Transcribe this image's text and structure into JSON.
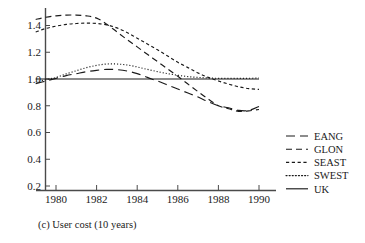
{
  "chart_data": {
    "type": "line",
    "title": "",
    "caption": "(c) User cost  (10 years)",
    "xlabel": "",
    "ylabel": "",
    "xlim": [
      1978.6,
      1990.9
    ],
    "ylim": [
      0.1,
      1.5
    ],
    "grid": false,
    "legend_position": "right",
    "xticks": [
      "1980",
      "1982",
      "1984",
      "1986",
      "1988",
      "1990"
    ],
    "xtick_values": [
      1980,
      1982,
      1984,
      1986,
      1988,
      1990
    ],
    "yticks": [
      "0.2",
      "0.4",
      "0.6",
      "0.8",
      "1.0",
      "1.2",
      "1.4"
    ],
    "ytick_values": [
      0.2,
      0.4,
      0.6,
      0.8,
      1.0,
      1.2,
      1.4
    ],
    "x": [
      1979,
      1979.5,
      1980,
      1980.5,
      1981,
      1981.5,
      1982,
      1982.5,
      1983,
      1983.5,
      1984,
      1984.5,
      1985,
      1985.5,
      1986,
      1986.5,
      1987,
      1987.5,
      1988,
      1988.5,
      1989,
      1989.5,
      1990
    ],
    "series": [
      {
        "name": "EANG",
        "dash": "long-dash",
        "values": [
          0.965,
          0.985,
          1.005,
          1.025,
          1.04,
          1.055,
          1.065,
          1.072,
          1.07,
          1.06,
          1.04,
          1.012,
          0.985,
          0.955,
          0.925,
          0.895,
          0.865,
          0.83,
          0.8,
          0.785,
          0.765,
          0.765,
          0.795
        ]
      },
      {
        "name": "GLON",
        "dash": "medium-dash",
        "values": [
          1.445,
          1.462,
          1.472,
          1.478,
          1.478,
          1.472,
          1.455,
          1.41,
          1.352,
          1.295,
          1.24,
          1.185,
          1.13,
          1.075,
          1.02,
          0.962,
          0.905,
          0.85,
          0.8,
          0.778,
          0.758,
          0.762,
          0.772
        ]
      },
      {
        "name": "SEAST",
        "dash": "short-dash",
        "values": [
          1.352,
          1.378,
          1.395,
          1.408,
          1.415,
          1.418,
          1.415,
          1.405,
          1.382,
          1.348,
          1.305,
          1.262,
          1.218,
          1.172,
          1.125,
          1.085,
          1.045,
          1.012,
          0.985,
          0.962,
          0.942,
          0.928,
          0.922
        ]
      },
      {
        "name": "SWEST",
        "dash": "dotted",
        "values": [
          0.978,
          0.995,
          1.012,
          1.038,
          1.062,
          1.085,
          1.102,
          1.112,
          1.112,
          1.105,
          1.09,
          1.072,
          1.055,
          1.04,
          1.028,
          1.018,
          1.012,
          1.008,
          1.005,
          1.005,
          1.005,
          1.005,
          1.008
        ]
      },
      {
        "name": "UK",
        "dash": "solid",
        "values": [
          1.0,
          1.0,
          1.0,
          1.0,
          1.0,
          1.0,
          1.0,
          1.0,
          1.0,
          1.0,
          1.0,
          1.0,
          1.0,
          1.0,
          1.0,
          1.0,
          1.0,
          1.0,
          1.0,
          1.0,
          1.0,
          1.0,
          1.0
        ]
      }
    ]
  },
  "legend": {
    "entries": [
      {
        "label": "EANG"
      },
      {
        "label": "GLON"
      },
      {
        "label": "SEAST"
      },
      {
        "label": "SWEST"
      },
      {
        "label": "UK"
      }
    ]
  },
  "caption": {
    "text": "(c) User cost  (10 years)"
  },
  "colors": {
    "ink": "#1a1a1a",
    "axis": "#4a4a4a",
    "background": "#ffffff"
  }
}
